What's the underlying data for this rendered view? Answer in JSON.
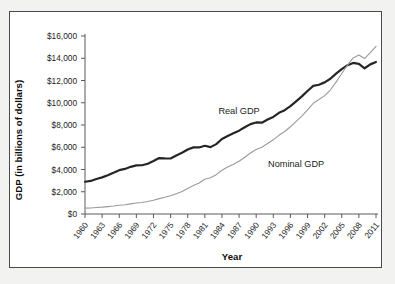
{
  "chart_data": {
    "type": "line",
    "title": "",
    "xlabel": "Year",
    "ylabel": "GDP (in billions of dollars)",
    "xlim": [
      1960,
      2011
    ],
    "ylim": [
      0,
      16000
    ],
    "grid": false,
    "legend": "inline-annotations",
    "ytick_labels": [
      "$0",
      "$2,000",
      "$4,000",
      "$6,000",
      "$8,000",
      "$10,000",
      "$12,000",
      "$14,000",
      "$16,000"
    ],
    "ytick_values": [
      0,
      2000,
      4000,
      6000,
      8000,
      10000,
      12000,
      14000,
      16000
    ],
    "xtick_labels": [
      "1960",
      "1963",
      "1966",
      "1969",
      "1972",
      "1975",
      "1978",
      "1981",
      "1984",
      "1987",
      "1990",
      "1993",
      "1996",
      "1999",
      "2002",
      "2005",
      "2008",
      "2011"
    ],
    "xtick_values": [
      1960,
      1963,
      1966,
      1969,
      1972,
      1975,
      1978,
      1981,
      1984,
      1987,
      1990,
      1993,
      1996,
      1999,
      2002,
      2005,
      2008,
      2011
    ],
    "x": [
      1960,
      1961,
      1962,
      1963,
      1964,
      1965,
      1966,
      1967,
      1968,
      1969,
      1970,
      1971,
      1972,
      1973,
      1974,
      1975,
      1976,
      1977,
      1978,
      1979,
      1980,
      1981,
      1982,
      1983,
      1984,
      1985,
      1986,
      1987,
      1988,
      1989,
      1990,
      1991,
      1992,
      1993,
      1994,
      1995,
      1996,
      1997,
      1998,
      1999,
      2000,
      2001,
      2002,
      2003,
      2004,
      2005,
      2006,
      2007,
      2008,
      2009,
      2010,
      2011
    ],
    "series": [
      {
        "name": "Real GDP",
        "label": "Real GDP",
        "color": "#262626",
        "width": 2.2,
        "label_x": 1987,
        "label_y": 9000,
        "values": [
          2900,
          2970,
          3150,
          3290,
          3480,
          3700,
          3940,
          4050,
          4240,
          4370,
          4380,
          4520,
          4760,
          5030,
          5000,
          4990,
          5260,
          5500,
          5800,
          5990,
          5980,
          6130,
          6010,
          6280,
          6740,
          7010,
          7250,
          7490,
          7800,
          8080,
          8230,
          8210,
          8490,
          8730,
          9090,
          9330,
          9690,
          10130,
          10570,
          11060,
          11510,
          11620,
          11830,
          12160,
          12620,
          13030,
          13380,
          13580,
          13500,
          13100,
          13450,
          13660
        ]
      },
      {
        "name": "Nominal GDP",
        "label": "Nominal GDP",
        "color": "#9a9a9a",
        "width": 1.1,
        "label_x": 1997,
        "label_y": 4200,
        "values": [
          526,
          545,
          586,
          618,
          664,
          719,
          788,
          833,
          910,
          985,
          1040,
          1129,
          1238,
          1383,
          1500,
          1638,
          1825,
          2031,
          2294,
          2563,
          2790,
          3128,
          3255,
          3537,
          3933,
          4220,
          4463,
          4740,
          5104,
          5484,
          5803,
          5996,
          6340,
          6667,
          7085,
          7415,
          7839,
          8332,
          8794,
          9354,
          9952,
          10286,
          10642,
          11142,
          11853,
          12623,
          13377,
          14029,
          14292,
          13974,
          14499,
          15076
        ]
      }
    ]
  }
}
